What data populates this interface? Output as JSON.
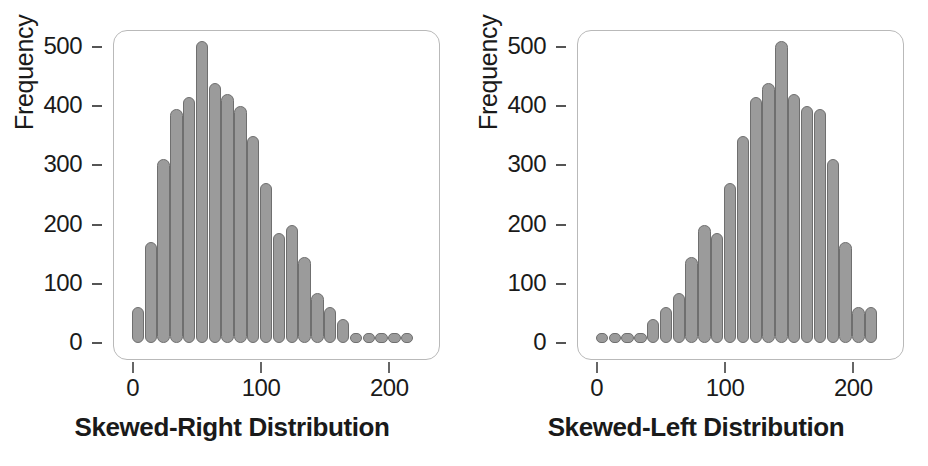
{
  "figure": {
    "background_color": "#ffffff",
    "bar_fill_color": "#9b9b9b",
    "bar_edge_color": "#6f6f6f",
    "frame_color": "#b9b9b9",
    "text_color": "#1a1a1a"
  },
  "panels": [
    {
      "id": "skewed-right",
      "title": "Skewed-Right Distribution",
      "ylabel": "Frequency",
      "xticks": [
        "0",
        "100",
        "200"
      ],
      "yticks": [
        "0",
        "100",
        "200",
        "300",
        "400",
        "500"
      ]
    },
    {
      "id": "skewed-left",
      "title": "Skewed-Left Distribution",
      "ylabel": "Frequency",
      "xticks": [
        "0",
        "100",
        "200"
      ],
      "yticks": [
        "0",
        "100",
        "200",
        "300",
        "400",
        "500"
      ]
    }
  ],
  "chart_data": [
    {
      "type": "bar",
      "id": "skewed-right",
      "title": "Skewed-Right Distribution",
      "xlabel": "",
      "ylabel": "Frequency",
      "xlim": [
        0,
        230
      ],
      "ylim": [
        0,
        530
      ],
      "grid": false,
      "legend": null,
      "xticks": [
        0,
        100,
        200
      ],
      "yticks": [
        0,
        100,
        200,
        300,
        400,
        500
      ],
      "bin_width": 10,
      "categories": [
        5,
        15,
        25,
        35,
        45,
        55,
        65,
        75,
        85,
        95,
        105,
        115,
        125,
        135,
        145,
        155,
        165,
        175,
        185,
        195,
        205,
        215
      ],
      "values": [
        60,
        170,
        310,
        395,
        415,
        510,
        440,
        420,
        400,
        350,
        270,
        185,
        200,
        145,
        85,
        60,
        40,
        15,
        15,
        15,
        10,
        10
      ]
    },
    {
      "type": "bar",
      "id": "skewed-left",
      "title": "Skewed-Left Distribution",
      "xlabel": "",
      "ylabel": "Frequency",
      "xlim": [
        0,
        230
      ],
      "ylim": [
        0,
        530
      ],
      "grid": false,
      "legend": null,
      "xticks": [
        0,
        100,
        200
      ],
      "yticks": [
        0,
        100,
        200,
        300,
        400,
        500
      ],
      "bin_width": 10,
      "categories": [
        5,
        15,
        25,
        35,
        45,
        55,
        65,
        75,
        85,
        95,
        105,
        115,
        125,
        135,
        145,
        155,
        165,
        175,
        185,
        195,
        205,
        215
      ],
      "values": [
        10,
        10,
        10,
        15,
        40,
        60,
        85,
        145,
        200,
        185,
        270,
        350,
        415,
        440,
        510,
        420,
        400,
        395,
        310,
        170,
        60,
        60
      ]
    }
  ]
}
